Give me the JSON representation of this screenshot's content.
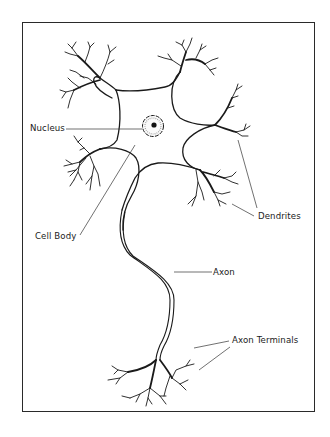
{
  "diagram": {
    "labels": {
      "nucleus": "Nucleus",
      "cell_body": "Cell Body",
      "dendrites": "Dendrites",
      "axon": "Axon",
      "axon_terminals": "Axon Terminals"
    }
  }
}
